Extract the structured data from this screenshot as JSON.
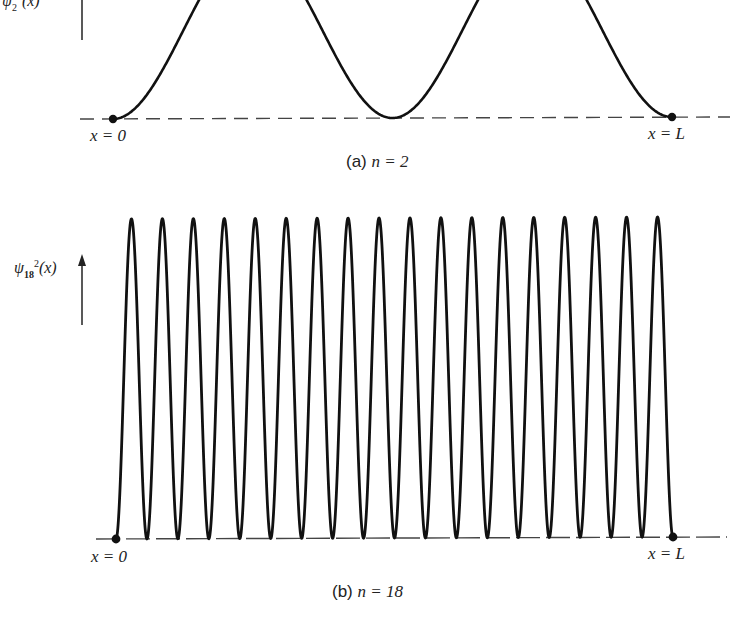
{
  "chart_data": [
    {
      "type": "line",
      "title": "(a) n = 2",
      "caption_prefix": "(a)",
      "caption_n": "n = 2",
      "ylabel": "ψ₂²(x)",
      "xlabel_left": "x = 0",
      "xlabel_right": "x = L",
      "function": "sin^2(2πx/L)",
      "n": 2,
      "x": [
        0,
        0.125,
        0.25,
        0.375,
        0.5,
        0.625,
        0.75,
        0.875,
        1.0
      ],
      "values": [
        0,
        0.5,
        1,
        0.5,
        0,
        0.5,
        1,
        0.5,
        0
      ],
      "xlim": [
        0,
        1
      ],
      "ylim": [
        0,
        1
      ],
      "grid": false,
      "baseline": "dashed",
      "endpoints_marked": true,
      "note": "Peaks cropped at top of image"
    },
    {
      "type": "line",
      "title": "(b) n = 18",
      "caption_prefix": "(b)",
      "caption_n": "n = 18",
      "ylabel": "ψ₁₈²(x)",
      "xlabel_left": "x = 0",
      "xlabel_right": "x = L",
      "function": "sin^2(18πx/L)",
      "n": 18,
      "peak_count": 18,
      "xlim": [
        0,
        1
      ],
      "ylim": [
        0,
        1
      ],
      "grid": false,
      "baseline": "dashed",
      "endpoints_marked": true
    }
  ],
  "plot_a": {
    "ylabel_main": "ψ",
    "ylabel_sub": "2",
    "ylabel_sup": "2",
    "ylabel_arg": "(x)",
    "x0_label": "x = 0",
    "xL_label": "x = L",
    "caption_prefix": "(a)",
    "caption_n": "n = 2"
  },
  "plot_b": {
    "ylabel_main": "ψ",
    "ylabel_sub": "18",
    "ylabel_sup": "2",
    "ylabel_arg": "(x)",
    "x0_label": "x = 0",
    "xL_label": "x = L",
    "caption_prefix": "(b)",
    "caption_n": "n = 18"
  },
  "colors": {
    "curve": "#111111",
    "baseline": "#444444",
    "background": "#ffffff"
  }
}
